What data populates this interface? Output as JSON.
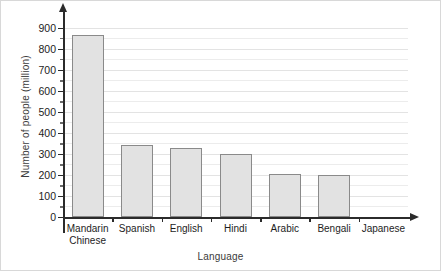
{
  "chart_data": {
    "type": "bar",
    "title": "",
    "xlabel": "Language",
    "ylabel": "Number of people (million)",
    "categories": [
      "Mandarin Chinese",
      "Spanish",
      "English",
      "Hindi",
      "Arabic",
      "Bengali",
      "Japanese"
    ],
    "values": [
      865,
      340,
      330,
      300,
      205,
      200,
      0
    ],
    "ylim": [
      0,
      950
    ],
    "ytick_labels": [
      "0",
      "100",
      "200",
      "300",
      "400",
      "500",
      "600",
      "700",
      "800",
      "900"
    ],
    "ytick_values": [
      0,
      100,
      200,
      300,
      400,
      500,
      600,
      700,
      800,
      900
    ],
    "minor_gridline_step": 50,
    "grid": true,
    "legend": "none",
    "bar_fill_color": "#e2e2e2",
    "bar_border_color": "#8a8a8a",
    "axis_color": "#2b2b2b",
    "gridline_color": "#ececec"
  },
  "axis": {
    "y_title": "Number of people (million)",
    "x_title": "Language"
  },
  "category_labels": [
    "Mandarin\nChinese",
    "Spanish",
    "English",
    "Hindi",
    "Arabic",
    "Bengali",
    "Japanese"
  ]
}
